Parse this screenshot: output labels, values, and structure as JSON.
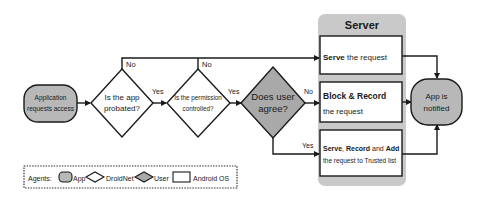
{
  "colors": {
    "line": "#1a1a1a",
    "app_fill": "#b8b8b8",
    "user_fill": "#a9a9a9",
    "server_panel": "#c9c9c9",
    "box_fill": "#ffffff",
    "background": "#ffffff"
  },
  "start": {
    "line1": "Application",
    "line2": "requests access"
  },
  "decisions": [
    {
      "id": "probated",
      "line1": "Is the app",
      "line2": "probated?",
      "agent": "DroidNet"
    },
    {
      "id": "permission",
      "line1": "Is the permission",
      "line2": "controlled?",
      "agent": "DroidNet"
    },
    {
      "id": "user",
      "line1": "Does user",
      "line2": "agree?",
      "agent": "User"
    }
  ],
  "edges": {
    "probated_no": "No",
    "probated_yes": "Yes",
    "permission_no": "No",
    "permission_yes": "Yes",
    "user_no": "No",
    "user_yes": "Yes"
  },
  "server": {
    "title": "Server",
    "boxes": [
      {
        "bold": "Serve",
        "rest": " the request"
      },
      {
        "bold": "Block & Record",
        "line2": "the request"
      },
      {
        "bold1": "Serve",
        "sep1": ", ",
        "bold2": "Record",
        "sep2": " and ",
        "bold3": "Add",
        "line2": "the request to Trusted list"
      }
    ]
  },
  "end": {
    "line1": "App is",
    "line2": "notified"
  },
  "legend": {
    "label": "Agents:",
    "items": [
      {
        "shape": "rounded-rect-gray",
        "label": "App"
      },
      {
        "shape": "diamond-white",
        "label": "DroidNet"
      },
      {
        "shape": "diamond-gray",
        "label": "User"
      },
      {
        "shape": "rect-white",
        "label": "Android OS"
      }
    ]
  }
}
